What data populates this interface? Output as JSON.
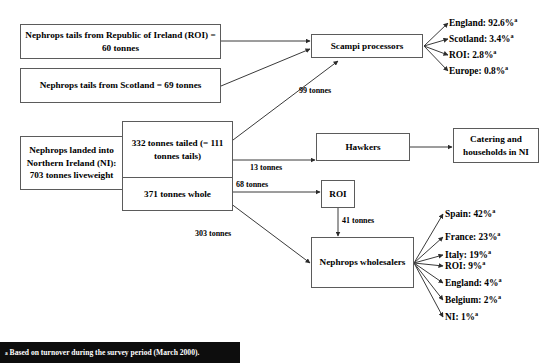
{
  "diagram": {
    "footnote_marker": "a",
    "footnote_text": "Based on turnover during the survey period (March 2000).",
    "nodes": {
      "tails_roi": "Nephrops tails from Republic of Ireland (ROI) = 60 tonnes",
      "tails_scotland": "Nephrops tails from Scotland = 69 tonnes",
      "landed_ni": "Nephrops landed into Northern Ireland (NI): 703 tonnes liveweight",
      "tailed": "332 tonnes tailed (= 111 tonnes tails)",
      "whole": "371 tonnes whole",
      "scampi_processors": "Scampi processors",
      "hawkers": "Hawkers",
      "catering": "Catering and households in NI",
      "roi": "ROI",
      "wholesalers": "Nephrops wholesalers"
    },
    "edge_labels": {
      "to_scampi": "99 tonnes",
      "to_hawkers": "13 tonnes",
      "to_roi": "68 tonnes",
      "roi_to_wholesalers": "41 tonnes",
      "whole_to_wholesalers": "303 tonnes"
    },
    "scampi_destinations": [
      {
        "label": "England: 92.6%",
        "marker": "a"
      },
      {
        "label": "Scotland: 3.4%",
        "marker": "a"
      },
      {
        "label": "ROI: 2.8%",
        "marker": "a"
      },
      {
        "label": "Europe: 0.8%",
        "marker": "a"
      }
    ],
    "wholesaler_destinations": [
      {
        "label": "Spain: 42%",
        "marker": "a"
      },
      {
        "label": "France: 23%",
        "marker": "a"
      },
      {
        "label": "Italy: 19%",
        "marker": "a"
      },
      {
        "label": "ROI: 9%",
        "marker": "a"
      },
      {
        "label": "England: 4%",
        "marker": "a"
      },
      {
        "label": "Belgium: 2%",
        "marker": "a"
      },
      {
        "label": "NI: 1%",
        "marker": "a"
      }
    ]
  },
  "colors": {
    "line": "#3a3a3a",
    "box_border": "#5b5b5b",
    "text": "#000000",
    "footnote_bg": "#0d0d0d",
    "footnote_text": "#ffffff"
  }
}
